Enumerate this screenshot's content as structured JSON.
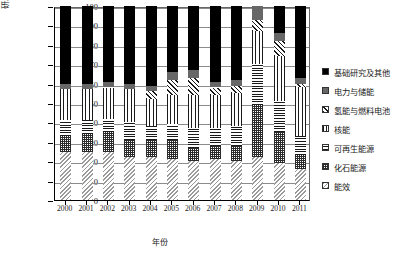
{
  "chart_data": {
    "type": "bar",
    "subtype": "stacked-bar-100-percent",
    "title": "",
    "xlabel": "年份",
    "ylabel": "研发示范经费占比/%",
    "ylim": [
      0,
      100
    ],
    "ytick_step": 10,
    "yticks": [
      "0",
      "10",
      "20",
      "30",
      "40",
      "50",
      "60",
      "70",
      "80",
      "90",
      "100"
    ],
    "grid": true,
    "grid_axis": "y",
    "legend_position": "right",
    "categories": [
      "2000",
      "2001",
      "2002",
      "2003",
      "2004",
      "2005",
      "2006",
      "2007",
      "2008",
      "2009",
      "2010",
      "2011"
    ],
    "series": [
      {
        "name": "能效",
        "pattern": "efficiency",
        "values": [
          25,
          25,
          25,
          22,
          22,
          21,
          20,
          21,
          20,
          22,
          19,
          16
        ]
      },
      {
        "name": "化石能源",
        "pattern": "fossil",
        "values": [
          8,
          9,
          10,
          9,
          9,
          10,
          7,
          7,
          8,
          27,
          16,
          7
        ]
      },
      {
        "name": "可再生能源",
        "pattern": "renewable",
        "values": [
          8,
          7,
          7,
          9,
          7,
          8,
          10,
          9,
          10,
          21,
          16,
          10
        ]
      },
      {
        "name": "核能",
        "pattern": "nuclear",
        "values": [
          16,
          16,
          16,
          17,
          14,
          15,
          17,
          17,
          17,
          17,
          23,
          25
        ]
      },
      {
        "name": "氢能与燃料电池",
        "pattern": "hydrogen",
        "values": [
          0,
          0,
          0,
          0,
          4,
          8,
          9,
          4,
          4,
          6,
          8,
          2
        ]
      },
      {
        "name": "电力与储能",
        "pattern": "gray",
        "values": [
          3,
          3,
          3,
          3,
          3,
          4,
          4,
          3,
          3,
          7,
          4,
          3
        ]
      },
      {
        "name": "基础研究及其他",
        "pattern": "black",
        "values": [
          40,
          40,
          39,
          40,
          41,
          34,
          33,
          39,
          38,
          0,
          14,
          37
        ]
      }
    ],
    "legend_entries": [
      {
        "label": "基础研究及其他",
        "pattern": "black"
      },
      {
        "label": "电力与储能",
        "pattern": "gray"
      },
      {
        "label": "氢能与燃料电池",
        "pattern": "hydrogen"
      },
      {
        "label": "核能",
        "pattern": "nuclear"
      },
      {
        "label": "可再生能源",
        "pattern": "renewable"
      },
      {
        "label": "化石能源",
        "pattern": "fossil"
      },
      {
        "label": "能效",
        "pattern": "efficiency"
      }
    ]
  }
}
